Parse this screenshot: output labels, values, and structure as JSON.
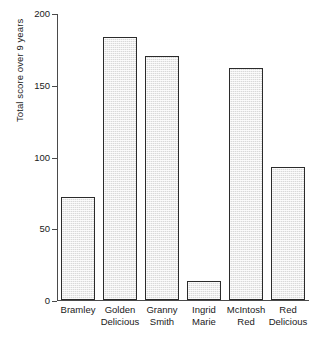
{
  "chart_data": {
    "type": "bar",
    "title": "",
    "subtitle": "",
    "xlabel": "",
    "ylabel": "Total score over 9 years",
    "ylim": [
      0,
      200
    ],
    "yticks": [
      0,
      50,
      100,
      150,
      200
    ],
    "ytick_labels": [
      "0",
      "50",
      "100",
      "150",
      "200"
    ],
    "grid": false,
    "legend": false,
    "categories": [
      "Bramley",
      "Golden Delicious",
      "Granny Smith",
      "Ingrid Marie",
      "McIntosh Red",
      "Red Delicious"
    ],
    "category_lines": [
      [
        "Bramley",
        ""
      ],
      [
        "Golden",
        "Delicious"
      ],
      [
        "Granny",
        "Smith"
      ],
      [
        "Ingrid",
        "Marie"
      ],
      [
        "McIntosh",
        "Red"
      ],
      [
        "Red",
        "Delicious"
      ]
    ],
    "values": [
      72,
      183,
      170,
      13,
      162,
      93
    ],
    "bar_fill_color": "#d9d9d9",
    "bar_edge_color": "#2b2b2b",
    "axis_color": "#4a4a4a",
    "background_color": "#ffffff"
  }
}
